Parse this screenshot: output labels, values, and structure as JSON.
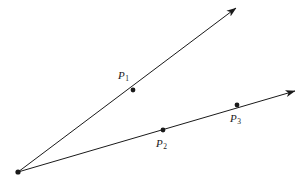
{
  "figure": {
    "background_color": "#ffffff",
    "stroke_color": "#1a1a1a",
    "stroke_width": 1,
    "width": 308,
    "height": 184
  },
  "chart_data": {
    "type": "diagram",
    "title": "",
    "xlabel": "",
    "ylabel": "",
    "grid": false,
    "legend": null,
    "vertex": {
      "name": "origin",
      "x": 18,
      "y": 172,
      "labeled": false
    },
    "rays": [
      {
        "name": "upper-ray",
        "from": {
          "x": 18,
          "y": 172
        },
        "to": {
          "x": 236,
          "y": 8
        },
        "arrow_at": "to",
        "points_on_ray": [
          "P1"
        ]
      },
      {
        "name": "lower-ray",
        "from": {
          "x": 18,
          "y": 172
        },
        "to": {
          "x": 295,
          "y": 91
        },
        "arrow_at": "to",
        "points_on_ray": [
          "P2",
          "P3"
        ]
      }
    ],
    "points": [
      {
        "id": "P1",
        "label_base": "P",
        "label_sub": "1",
        "x": 133,
        "y": 90,
        "label_x": 118,
        "label_y": 70,
        "on_ray": "upper-ray"
      },
      {
        "id": "P2",
        "label_base": "P",
        "label_sub": "2",
        "x": 163,
        "y": 130,
        "label_x": 156,
        "label_y": 138,
        "on_ray": "lower-ray"
      },
      {
        "id": "P3",
        "label_base": "P",
        "label_sub": "3",
        "x": 237,
        "y": 105,
        "label_x": 230,
        "label_y": 113,
        "on_ray": "lower-ray"
      }
    ]
  }
}
